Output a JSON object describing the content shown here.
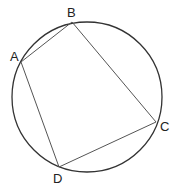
{
  "diagram": {
    "circle": {
      "cx": 87,
      "cy": 97,
      "r": 75,
      "stroke": "#333333"
    },
    "points": [
      {
        "name": "A",
        "x": 21,
        "y": 62,
        "label_x": 10,
        "label_y": 61
      },
      {
        "name": "B",
        "x": 72,
        "y": 22,
        "label_x": 67,
        "label_y": 17
      },
      {
        "name": "C",
        "x": 156,
        "y": 122,
        "label_x": 160,
        "label_y": 131
      },
      {
        "name": "D",
        "x": 59,
        "y": 167,
        "label_x": 53,
        "label_y": 183
      }
    ],
    "edge_color": "#555555"
  }
}
